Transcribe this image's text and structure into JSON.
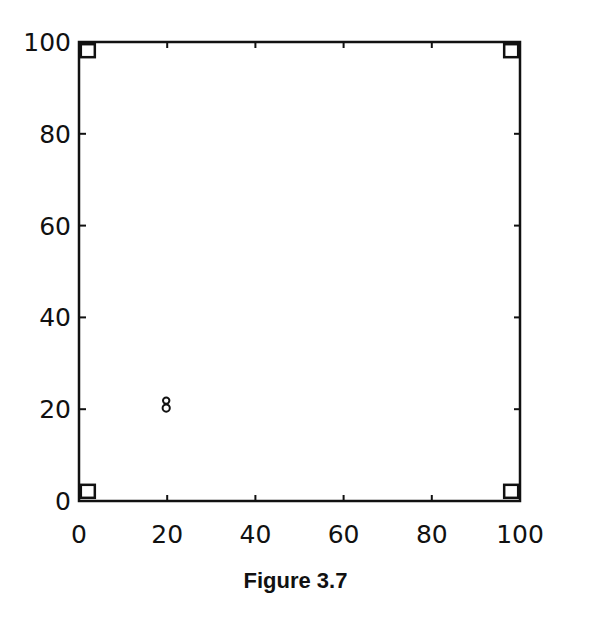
{
  "caption": "Figure 3.7",
  "chart_data": {
    "type": "scatter",
    "title": "",
    "xlabel": "",
    "ylabel": "",
    "xlim": [
      0,
      100
    ],
    "ylim": [
      0,
      100
    ],
    "grid": false,
    "legend": null,
    "x_ticks": [
      0,
      20,
      40,
      60,
      80,
      100
    ],
    "y_ticks": [
      0,
      20,
      40,
      60,
      80,
      100
    ],
    "x_tick_labels": [
      "0",
      "20",
      "40",
      "60",
      "80",
      "100"
    ],
    "y_tick_labels": [
      "0",
      "20",
      "40",
      "60",
      "80",
      "100"
    ],
    "series": [
      {
        "name": "corner points",
        "marker": "square",
        "points": [
          {
            "x": 2,
            "y": 98
          },
          {
            "x": 98,
            "y": 98
          },
          {
            "x": 2,
            "y": 2
          },
          {
            "x": 98,
            "y": 2
          }
        ]
      },
      {
        "name": "center point",
        "marker": "8-glyph",
        "points": [
          {
            "x": 20,
            "y": 21
          }
        ]
      }
    ],
    "annotations": [
      "Figure 3.7"
    ]
  }
}
